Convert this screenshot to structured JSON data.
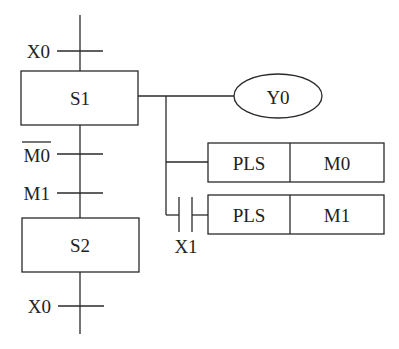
{
  "diagram": {
    "type": "SFC (sequential function chart) with ladder output",
    "steps": [
      {
        "id": "S1",
        "label": "S1"
      },
      {
        "id": "S2",
        "label": "S2"
      }
    ],
    "transitions": [
      {
        "position": "before S1",
        "label": "X0",
        "negated": false
      },
      {
        "position": "after S1 (1)",
        "label": "M0",
        "negated": true
      },
      {
        "position": "after S1 (2)",
        "label": "M1",
        "negated": false
      },
      {
        "position": "after S2",
        "label": "X0",
        "negated": false
      }
    ],
    "outputs": {
      "coil": {
        "label": "Y0"
      },
      "instructions": [
        {
          "op": "PLS",
          "operand": "M0",
          "condition": null
        },
        {
          "op": "PLS",
          "operand": "M1",
          "condition": "X1"
        }
      ],
      "contact": {
        "label": "X1",
        "type": "normally-open"
      }
    },
    "colors": {
      "line": "#2a2a2a",
      "background": "#ffffff"
    }
  }
}
